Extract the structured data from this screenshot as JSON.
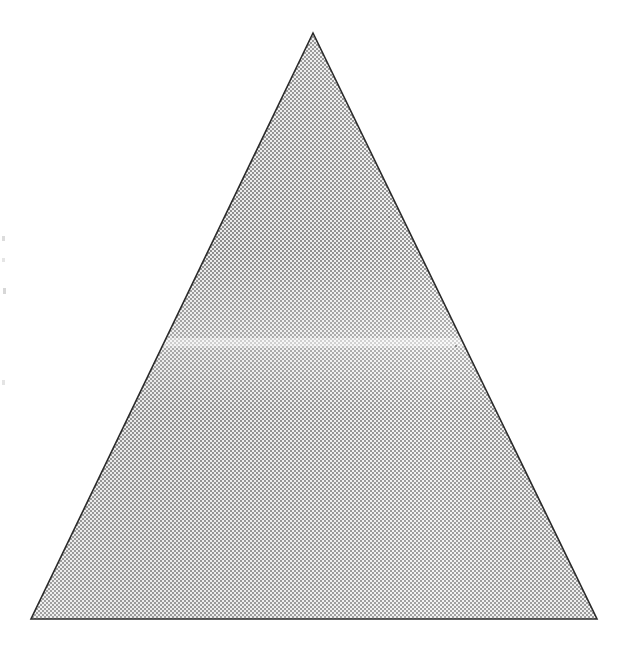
{
  "document": {
    "type": "scanned-figure",
    "page_background": "#ffffff",
    "width": 626,
    "height": 662,
    "caption": "",
    "title": "",
    "has_text": false
  },
  "figure": {
    "name": "shaded-triangle",
    "shape": "triangle",
    "orientation": "apex-up",
    "classification": "isosceles",
    "outline_color": "#2b2b2b",
    "outline_width_px": 1.6,
    "fill_style": "halftone-dither-gray",
    "fill_gray_hex": "#b8b8b8",
    "fill_light_hex": "#e8e8e8",
    "fill_dark_hex": "#8a8a8a",
    "vertices": {
      "apex": {
        "label": "apex",
        "x": 313,
        "y": 33
      },
      "bottom_left": {
        "label": "bottom-left",
        "x": 31,
        "y": 619
      },
      "bottom_right": {
        "label": "bottom-right",
        "x": 597,
        "y": 619
      }
    },
    "base_width_px": 566,
    "height_px": 586,
    "apex_angle_deg": 51.8,
    "base_angle_deg": 64.1
  },
  "artifacts": {
    "scan_band": {
      "name": "horizontal-scan-band",
      "description": "faint lighter horizontal band across the triangle",
      "y": 341,
      "height_px": 8,
      "color": "#dedede"
    },
    "edge_specks": [
      {
        "x": 2,
        "y": 236,
        "w": 3,
        "h": 5
      },
      {
        "x": 2,
        "y": 258,
        "w": 3,
        "h": 4
      },
      {
        "x": 3,
        "y": 288,
        "w": 3,
        "h": 6
      },
      {
        "x": 2,
        "y": 380,
        "w": 3,
        "h": 5
      }
    ],
    "interior_specks": [
      {
        "x": 388,
        "y": 216,
        "w": 2,
        "h": 2
      },
      {
        "x": 455,
        "y": 345,
        "w": 2,
        "h": 2
      },
      {
        "x": 258,
        "y": 478,
        "w": 2,
        "h": 2
      }
    ]
  }
}
